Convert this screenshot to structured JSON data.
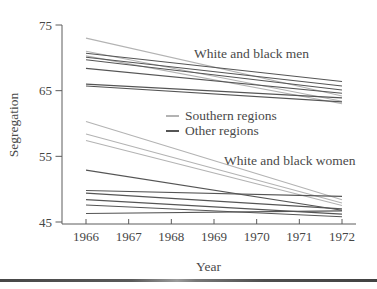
{
  "chart_data": {
    "type": "line",
    "title": "",
    "xlabel": "Year",
    "ylabel": "Segregation",
    "xlim": [
      1966,
      1972
    ],
    "ylim": [
      45,
      75
    ],
    "x_ticks": [
      1966,
      1967,
      1968,
      1969,
      1970,
      1971,
      1972
    ],
    "y_ticks": [
      45,
      55,
      65,
      75
    ],
    "grid": false,
    "legend_position": "center-left-inside",
    "legend": [
      {
        "label": "Southern regions",
        "color": "#b3b3b3"
      },
      {
        "label": "Other regions",
        "color": "#555555"
      }
    ],
    "annotations": [
      {
        "text": "White and black men",
        "x": 1970.2,
        "y": 70.6
      },
      {
        "text": "White and black women",
        "x": 1970.9,
        "y": 54.3
      }
    ],
    "x": [
      1966,
      1972
    ],
    "series": [
      {
        "name": "men-southern-1",
        "group": "White and black men",
        "region": "Southern regions",
        "color": "#b3b3b3",
        "values": [
          73.0,
          64.2
        ]
      },
      {
        "name": "men-southern-2",
        "group": "White and black men",
        "region": "Southern regions",
        "color": "#b3b3b3",
        "values": [
          71.0,
          63.4
        ]
      },
      {
        "name": "men-southern-3",
        "group": "White and black men",
        "region": "Southern regions",
        "color": "#b3b3b3",
        "values": [
          70.3,
          63.0
        ]
      },
      {
        "name": "men-other-1",
        "group": "White and black men",
        "region": "Other regions",
        "color": "#555555",
        "values": [
          70.7,
          66.4
        ]
      },
      {
        "name": "men-other-2",
        "group": "White and black men",
        "region": "Other regions",
        "color": "#555555",
        "values": [
          70.1,
          65.7
        ]
      },
      {
        "name": "men-other-3",
        "group": "White and black men",
        "region": "Other regions",
        "color": "#555555",
        "values": [
          69.7,
          65.1
        ]
      },
      {
        "name": "men-other-4",
        "group": "White and black men",
        "region": "Other regions",
        "color": "#555555",
        "values": [
          68.4,
          64.6
        ]
      },
      {
        "name": "men-other-5",
        "group": "White and black men",
        "region": "Other regions",
        "color": "#555555",
        "values": [
          66.0,
          63.9
        ]
      },
      {
        "name": "men-other-6",
        "group": "White and black men",
        "region": "Other regions",
        "color": "#555555",
        "values": [
          65.7,
          63.3
        ]
      },
      {
        "name": "women-southern-1",
        "group": "White and black women",
        "region": "Southern regions",
        "color": "#b3b3b3",
        "values": [
          60.3,
          48.4
        ]
      },
      {
        "name": "women-southern-2",
        "group": "White and black women",
        "region": "Southern regions",
        "color": "#b3b3b3",
        "values": [
          58.4,
          47.9
        ]
      },
      {
        "name": "women-southern-3",
        "group": "White and black women",
        "region": "Southern regions",
        "color": "#b3b3b3",
        "values": [
          57.4,
          47.5
        ]
      },
      {
        "name": "women-other-1",
        "group": "White and black women",
        "region": "Other regions",
        "color": "#555555",
        "values": [
          52.9,
          46.8
        ]
      },
      {
        "name": "women-other-2",
        "group": "White and black women",
        "region": "Other regions",
        "color": "#555555",
        "values": [
          49.8,
          48.9
        ]
      },
      {
        "name": "women-other-3",
        "group": "White and black women",
        "region": "Other regions",
        "color": "#555555",
        "values": [
          49.4,
          47.0
        ]
      },
      {
        "name": "women-other-4",
        "group": "White and black women",
        "region": "Other regions",
        "color": "#555555",
        "values": [
          48.4,
          46.2
        ]
      },
      {
        "name": "women-other-5",
        "group": "White and black women",
        "region": "Other regions",
        "color": "#555555",
        "values": [
          47.6,
          45.8
        ]
      },
      {
        "name": "women-other-6",
        "group": "White and black women",
        "region": "Other regions",
        "color": "#555555",
        "values": [
          46.3,
          46.7
        ]
      }
    ]
  }
}
